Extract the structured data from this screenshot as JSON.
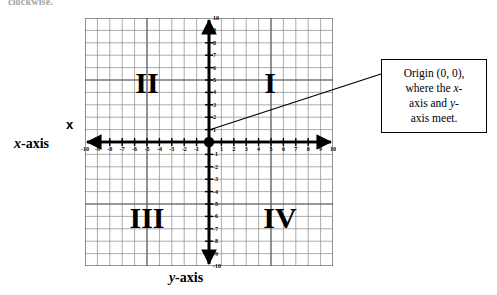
{
  "top_fragment": "clockwise.",
  "labels": {
    "x_axis_prefix": "x",
    "x_axis_suffix": "-axis",
    "y_axis_prefix": "y",
    "y_axis_suffix": "-axis",
    "x_marker": "x"
  },
  "quadrants": [
    {
      "name": "quadrant-1",
      "label": "I",
      "x": 185,
      "y": 65
    },
    {
      "name": "quadrant-2",
      "label": "II",
      "x": 62,
      "y": 65
    },
    {
      "name": "quadrant-3",
      "label": "III",
      "x": 62,
      "y": 200
    },
    {
      "name": "quadrant-4",
      "label": "IV",
      "x": 195,
      "y": 200
    }
  ],
  "callout": {
    "line1": "Origin (0, 0),",
    "line2_pre": "where the ",
    "line2_it": "x",
    "line2_post": "-",
    "line3_pre": "axis and ",
    "line3_it": "y",
    "line3_post": "-",
    "line4": "axis meet."
  },
  "chart_data": {
    "type": "scatter",
    "xlabel": "x-axis",
    "ylabel": "y-axis",
    "xlim": [
      -10,
      10
    ],
    "ylim": [
      -10,
      10
    ],
    "grid": true,
    "legend": "none",
    "x_ticks": [
      -10,
      -9,
      -8,
      -7,
      -6,
      -5,
      -4,
      -3,
      -2,
      -1,
      1,
      2,
      3,
      4,
      5,
      6,
      7,
      8,
      9,
      10
    ],
    "y_ticks": [
      10,
      9,
      8,
      7,
      6,
      5,
      4,
      3,
      2,
      1,
      -1,
      -2,
      -3,
      -4,
      -5,
      -6,
      -7,
      -8,
      -9,
      -10
    ],
    "points": [
      {
        "label": "Origin (0, 0)",
        "x": 0,
        "y": 0
      }
    ],
    "annotations": [
      {
        "text": "Origin (0, 0), where the x-axis and y-axis meet.",
        "target_x": 0,
        "target_y": 0
      },
      {
        "text": "I",
        "x": 5,
        "y": 6
      },
      {
        "text": "II",
        "x": -5,
        "y": 6
      },
      {
        "text": "III",
        "x": -5,
        "y": -6
      },
      {
        "text": "IV",
        "x": 5,
        "y": -6
      }
    ]
  },
  "colors": {
    "axis": "#000000",
    "grid": "#777777",
    "background": "#ffffff",
    "text": "#000000"
  }
}
